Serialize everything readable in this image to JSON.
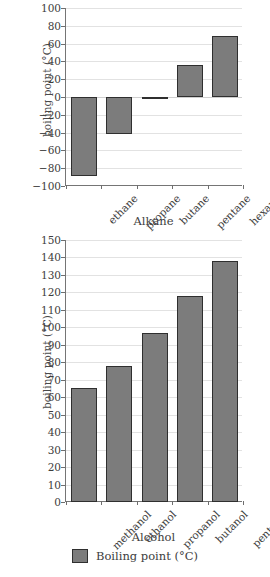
{
  "chart_data": [
    {
      "id": "alkane",
      "type": "bar",
      "title": "",
      "xlabel": "Alkane",
      "ylabel": "boiling point (°C)",
      "categories": [
        "ethane",
        "propane",
        "butane",
        "pentane",
        "hexane"
      ],
      "values": [
        -89,
        -42,
        -1,
        36,
        69
      ],
      "ylim": [
        -100,
        100
      ],
      "yticks": [
        100,
        80,
        60,
        40,
        20,
        0,
        -20,
        -40,
        -60,
        -80,
        -100
      ],
      "ytick_labels": [
        "100",
        "80",
        "60",
        "40",
        "20",
        "0",
        "−20",
        "−40",
        "−60",
        "−80",
        "−100"
      ],
      "grid": true,
      "legend_position": "bottom",
      "series_name": "Boiling point (°C)",
      "bar_color": "#7c7c7c",
      "bar_edge_color": "#2f2f2f"
    },
    {
      "id": "alcohol",
      "type": "bar",
      "title": "",
      "xlabel": "Alcohol",
      "ylabel": "boiling point (°C)",
      "categories": [
        "methanol",
        "ethanol",
        "propanol",
        "butanol",
        "pentanol"
      ],
      "values": [
        65,
        78,
        97,
        118,
        138
      ],
      "ylim": [
        0,
        150
      ],
      "yticks": [
        150,
        140,
        130,
        120,
        110,
        100,
        90,
        80,
        70,
        60,
        50,
        40,
        30,
        20,
        10,
        0
      ],
      "ytick_labels": [
        "150",
        "140",
        "130",
        "120",
        "110",
        "100",
        "90",
        "80",
        "70",
        "60",
        "50",
        "40",
        "30",
        "20",
        "10",
        "0"
      ],
      "grid": true,
      "legend_position": "bottom",
      "series_name": "Boiling point (°C)",
      "bar_color": "#7c7c7c",
      "bar_edge_color": "#2f2f2f"
    }
  ],
  "legend": {
    "label": "Boiling point (°C)",
    "swatch_color": "#7c7c7c"
  }
}
